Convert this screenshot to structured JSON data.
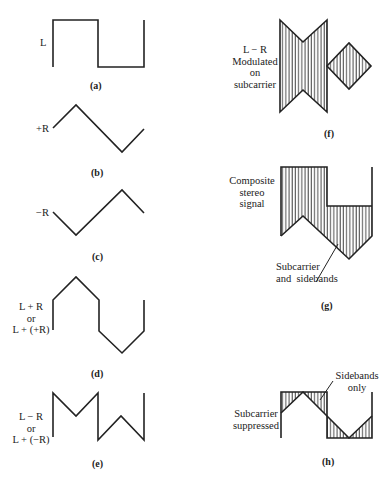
{
  "panels": {
    "a": {
      "caption": "(a)",
      "label": "L"
    },
    "b": {
      "caption": "(b)",
      "label": "+R"
    },
    "c": {
      "caption": "(c)",
      "label": "−R"
    },
    "d": {
      "caption": "(d)",
      "label_lines": [
        "L + R",
        "or",
        "L + (+R)"
      ]
    },
    "e": {
      "caption": "(e)",
      "label_lines": [
        "L − R",
        "or",
        "L + (−R)"
      ]
    },
    "f": {
      "caption": "(f)",
      "label_lines": [
        "L − R",
        "Modulated",
        "on",
        "subcarrier"
      ]
    },
    "g": {
      "caption": "(g)",
      "label_lines": [
        "Composite",
        "stereo",
        "signal"
      ],
      "annotation_lines": [
        "Subcarrier",
        "and  sidebands"
      ]
    },
    "h": {
      "caption": "(h)",
      "label_lines": [
        "Subcarrier",
        "suppressed"
      ],
      "annotation_lines": [
        "Sidebands",
        "only"
      ]
    }
  },
  "colors": {
    "stroke": "#222222",
    "hatch": "#333333",
    "background": "#ffffff"
  }
}
